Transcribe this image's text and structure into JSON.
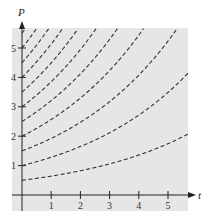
{
  "chart_data": {
    "type": "line",
    "title": "",
    "xlabel": "t",
    "ylabel": "P",
    "xlim": [
      0,
      5.7
    ],
    "ylim": [
      0,
      5.7
    ],
    "x_ticks": [
      1,
      2,
      3,
      4,
      5
    ],
    "y_ticks": [
      1,
      2,
      3,
      4,
      5
    ],
    "grid": false,
    "legend": null,
    "background": "#e6e6e6",
    "line_style": "dashed",
    "line_color": "#333333",
    "model": "P = P0 * exp(0.25 t)",
    "growth_rate": 0.25,
    "series": [
      {
        "name": "P0=0.5",
        "P0": 0.5
      },
      {
        "name": "P0=1.0",
        "P0": 1.0
      },
      {
        "name": "P0=1.5",
        "P0": 1.5
      },
      {
        "name": "P0=2.0",
        "P0": 2.0
      },
      {
        "name": "P0=2.5",
        "P0": 2.5
      },
      {
        "name": "P0=3.0",
        "P0": 3.0
      },
      {
        "name": "P0=3.5",
        "P0": 3.5
      },
      {
        "name": "P0=4.0",
        "P0": 4.0
      },
      {
        "name": "P0=4.5",
        "P0": 4.5
      },
      {
        "name": "P0=5.0",
        "P0": 5.0
      },
      {
        "name": "P0=5.5",
        "P0": 5.5
      }
    ]
  },
  "axes": {
    "x_label": "t",
    "y_label": "P",
    "x_tick_labels": [
      "1",
      "2",
      "3",
      "4",
      "5"
    ],
    "y_tick_labels": [
      "1",
      "2",
      "3",
      "4",
      "5"
    ]
  }
}
